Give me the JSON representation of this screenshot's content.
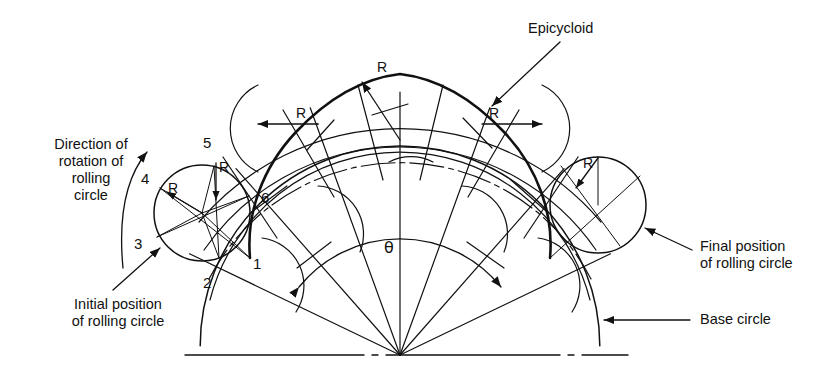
{
  "figure": {
    "type": "epicycloid-construction-diagram",
    "ink_color": "#111111",
    "background": "#ffffff"
  },
  "labels": {
    "epicycloid": "Epicycloid",
    "direction_of_rotation": "Direction of\nrotation of\nrolling\ncircle",
    "initial_position": "Initial position\nof rolling circle",
    "final_position": "Final position\nof rolling circle",
    "base_circle": "Base circle",
    "theta": "θ"
  },
  "radius_tags": [
    {
      "id": "r-left-circle",
      "text": "R"
    },
    {
      "id": "r-point5",
      "text": "R"
    },
    {
      "id": "r-left-dim",
      "text": "R"
    },
    {
      "id": "r-top",
      "text": "R"
    },
    {
      "id": "r-right-dim",
      "text": "R"
    },
    {
      "id": "r-right-circle",
      "text": "R"
    }
  ],
  "division_points": [
    {
      "label": "1"
    },
    {
      "label": "2"
    },
    {
      "label": "3"
    },
    {
      "label": "4"
    },
    {
      "label": "5"
    },
    {
      "label": "6"
    }
  ],
  "geometry": {
    "base_center": {
      "x": 400,
      "y": 355
    },
    "base_radius": 167,
    "rolling_radius": 48,
    "locus_radius": 215,
    "outer_radius": 263,
    "theta_degrees": 136,
    "divisions": 6
  }
}
